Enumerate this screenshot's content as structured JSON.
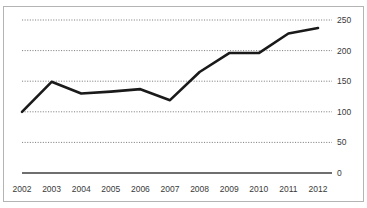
{
  "widget": {
    "title_sliver": "",
    "frame_color": "#b4b4b4",
    "background_color": "#ffffff",
    "series_color": "#1a1a1a",
    "gridline_color": "#808080",
    "axis_color": "#3f3f3f",
    "label_color": "#3a3a3a"
  },
  "chart_data": {
    "type": "line",
    "title": "",
    "xlabel": "",
    "ylabel": "",
    "categories": [
      "2002",
      "2003",
      "2004",
      "2005",
      "2006",
      "2007",
      "2008",
      "2009",
      "2010",
      "2011",
      "2012"
    ],
    "values": [
      100,
      149,
      130,
      133,
      137,
      119,
      165,
      196,
      196,
      228,
      237
    ],
    "series": [
      {
        "name": "",
        "values": [
          100,
          149,
          130,
          133,
          137,
          119,
          165,
          196,
          196,
          228,
          237
        ]
      }
    ],
    "ylim": [
      0,
      250
    ],
    "yticks": [
      0,
      50,
      100,
      150,
      200,
      250
    ],
    "ytick_labels": [
      "0",
      "50",
      "100",
      "150",
      "200",
      "250"
    ],
    "xtick_labels": [
      "2002",
      "2003",
      "2004",
      "2005",
      "2006",
      "2007",
      "2008",
      "2009",
      "2010",
      "2011",
      "2012"
    ],
    "grid": true,
    "grid_style": "dotted-horizontal",
    "legend": false,
    "legend_position": "none",
    "y_axis_position": "right"
  }
}
